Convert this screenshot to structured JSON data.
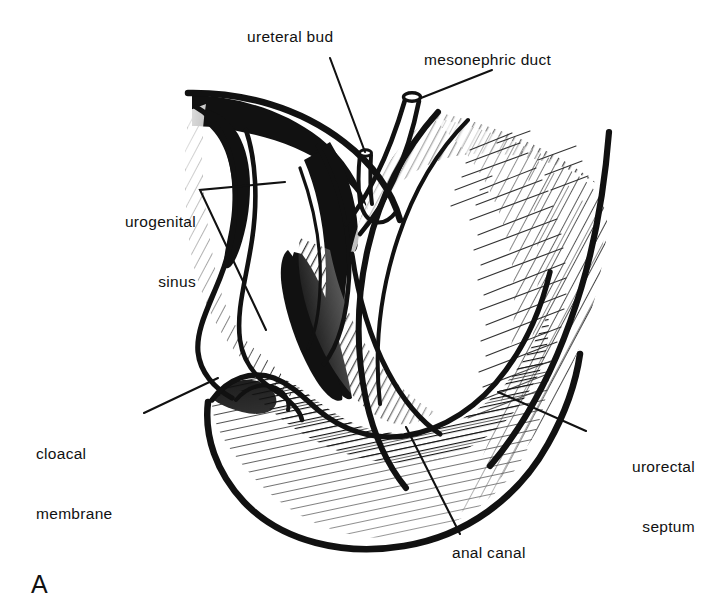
{
  "figure": {
    "panel_letter": "A",
    "background_color": "#ffffff",
    "ink_color": "#111111"
  },
  "labels": {
    "ureteral_bud": "ureteral bud",
    "mesonephric_duct": "mesonephric duct",
    "urogenital_sinus_line1": "urogenital",
    "urogenital_sinus_line2": "sinus",
    "cloacal_membrane_line1": "cloacal",
    "cloacal_membrane_line2": "membrane",
    "urorectal_septum_line1": "urorectal",
    "urorectal_septum_line2": "septum",
    "anal_canal": "anal canal"
  },
  "leader_lines": [
    {
      "name": "ureteral-bud-leader",
      "from": [
        330,
        60
      ],
      "to": [
        364,
        156
      ]
    },
    {
      "name": "mesonephric-duct-leader",
      "from": [
        490,
        72
      ],
      "to": [
        418,
        102
      ]
    },
    {
      "name": "urogenital-sinus-leader-upper",
      "from": [
        200,
        190
      ],
      "to": [
        283,
        182
      ]
    },
    {
      "name": "urogenital-sinus-leader-lower",
      "from": [
        200,
        190
      ],
      "to": [
        265,
        328
      ]
    },
    {
      "name": "cloacal-membrane-leader",
      "from": [
        146,
        412
      ],
      "to": [
        215,
        380
      ]
    },
    {
      "name": "urorectal-septum-leader",
      "from": [
        586,
        430
      ],
      "to": [
        500,
        392
      ]
    },
    {
      "name": "anal-canal-leader",
      "from": [
        460,
        536
      ],
      "to": [
        408,
        428
      ]
    }
  ]
}
